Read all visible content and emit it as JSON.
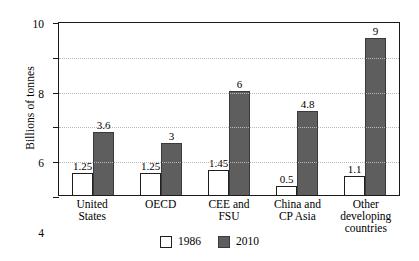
{
  "chart_data": {
    "type": "bar",
    "title": "",
    "xlabel": "",
    "ylabel": "Billions of tonnes",
    "ylim": [
      0,
      10
    ],
    "yticks": [
      0,
      2,
      4,
      6,
      8,
      10
    ],
    "ytick_labels": [
      "0",
      "2",
      "4",
      "6",
      "8",
      "10"
    ],
    "grid": "horizontal dotted gridlines at 2, 4, 6, 8",
    "legend_position": "bottom-center",
    "categories": [
      "United States",
      "OECD",
      "CEE and FSU",
      "China and CP Asia",
      "Other developing countries"
    ],
    "category_lines": [
      [
        "United",
        "States"
      ],
      [
        "OECD"
      ],
      [
        "CEE and",
        "FSU"
      ],
      [
        "China and",
        "CP Asia"
      ],
      [
        "Other",
        "developing",
        "countries"
      ]
    ],
    "series": [
      {
        "name": "1986",
        "color": "#ffffff",
        "values": [
          1.25,
          1.25,
          1.45,
          0.5,
          1.1
        ],
        "labels": [
          "1.25",
          "1.25",
          "1.45",
          "0.5",
          "1.1"
        ]
      },
      {
        "name": "2010",
        "color": "#5e5e5e",
        "values": [
          3.6,
          3,
          6,
          4.8,
          9
        ],
        "labels": [
          "3.6",
          "3",
          "6",
          "4.8",
          "9"
        ]
      }
    ]
  },
  "legend": [
    {
      "label": "1986",
      "swatch": "white-square-icon"
    },
    {
      "label": "2010",
      "swatch": "gray-square-icon"
    }
  ]
}
